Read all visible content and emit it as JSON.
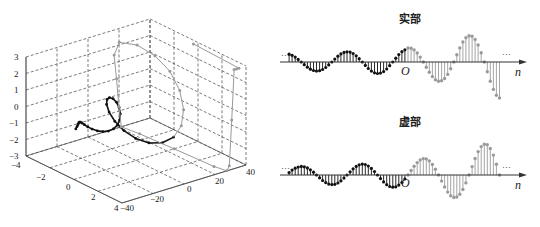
{
  "chart_data": [
    {
      "type": "line3d",
      "title": "",
      "description": "3D plot of complex exponential sequence: helix spiral growing along time axis; n<0 black dots, n>=0 gray dots",
      "axes": {
        "x": {
          "label": "",
          "ticks": [
            -4,
            -2,
            0,
            2,
            4
          ],
          "range": [
            -4,
            4
          ]
        },
        "y": {
          "label": "",
          "ticks": [
            -40,
            -20,
            0,
            20,
            40
          ],
          "range": [
            -40,
            40
          ]
        },
        "z": {
          "label": "",
          "ticks": [
            3,
            2,
            1,
            0,
            -1,
            -2,
            -3
          ],
          "range": [
            -3,
            3
          ]
        }
      },
      "grid": true,
      "series": [
        {
          "name": "n<0",
          "color": "#111111",
          "marker": "dot"
        },
        {
          "name": "n>=0",
          "color": "#9a9a9a",
          "marker": "dot"
        }
      ]
    },
    {
      "type": "stem",
      "title": "实部",
      "xlabel": "n",
      "origin_label": "O",
      "ellipsis_left": "···",
      "ellipsis_right": "···",
      "description": "Real part of growing complex exponential; decaying black stems for n<0, growing gray stems for n>=0",
      "series": [
        {
          "name": "n<0",
          "color": "#111111"
        },
        {
          "name": "n>=0",
          "color": "#9a9a9a"
        }
      ]
    },
    {
      "type": "stem",
      "title": "虚部",
      "xlabel": "n",
      "origin_label": "O",
      "ellipsis_left": "···",
      "ellipsis_right": "···",
      "description": "Imaginary part of growing complex exponential",
      "series": [
        {
          "name": "n<0",
          "color": "#111111"
        },
        {
          "name": "n>=0",
          "color": "#9a9a9a"
        }
      ]
    }
  ],
  "labels": {
    "real_title": "实部",
    "imag_title": "虚部",
    "n_label": "n",
    "origin": "O",
    "dots": "···",
    "z_ticks": [
      "3",
      "2",
      "1",
      "0",
      "−1",
      "−2",
      "−3"
    ],
    "x_ticks": [
      "−4",
      "−2",
      "0",
      "2",
      "4"
    ],
    "y_ticks": [
      "−40",
      "−20",
      "0",
      "20",
      "40"
    ]
  },
  "colors": {
    "neg": "#111111",
    "pos": "#9a9a9a",
    "axis": "#333333",
    "grid": "#444444"
  }
}
